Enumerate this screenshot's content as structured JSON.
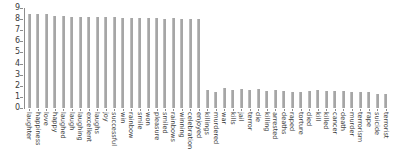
{
  "chart_data": {
    "type": "bar",
    "title": "",
    "xlabel": "",
    "ylabel": "",
    "ylim": [
      0,
      9
    ],
    "yticks": [
      0,
      1,
      2,
      3,
      4,
      5,
      6,
      7,
      8,
      9
    ],
    "ytick_labels": [
      "0",
      "1",
      "2",
      "3",
      "4",
      "5",
      "6",
      "7",
      "8",
      "9"
    ],
    "grid": false,
    "legend": null,
    "bar_color": "#a6a6a6",
    "axis_color": "#8c8c8c",
    "categories": [
      "laughter",
      "happiness",
      "love",
      "happy",
      "laughed",
      "laugh",
      "laughing",
      "excellent",
      "laughs",
      "joy",
      "successful",
      "win",
      "rainbow",
      "smile",
      "won",
      "pleasure",
      "smiled",
      "rainbows",
      "winning",
      "celebration",
      "enjoyed",
      "killings",
      "murdered",
      "war",
      "kills",
      "jail",
      "terror",
      "die",
      "killing",
      "arrested",
      "deaths",
      "raped",
      "torture",
      "died",
      "kill",
      "killed",
      "cancer",
      "death",
      "murder",
      "terrorism",
      "rape",
      "suicide",
      "terrorist"
    ],
    "values": [
      8.5,
      8.44,
      8.42,
      8.3,
      8.26,
      8.22,
      8.2,
      8.18,
      8.18,
      8.16,
      8.16,
      8.12,
      8.1,
      8.1,
      8.06,
      8.08,
      8.04,
      8.06,
      8.04,
      8.02,
      8.0,
      1.6,
      1.48,
      1.8,
      1.6,
      1.7,
      1.6,
      1.74,
      1.56,
      1.64,
      1.54,
      1.44,
      1.48,
      1.56,
      1.6,
      1.56,
      1.54,
      1.54,
      1.48,
      1.48,
      1.44,
      1.3,
      1.3
    ]
  }
}
